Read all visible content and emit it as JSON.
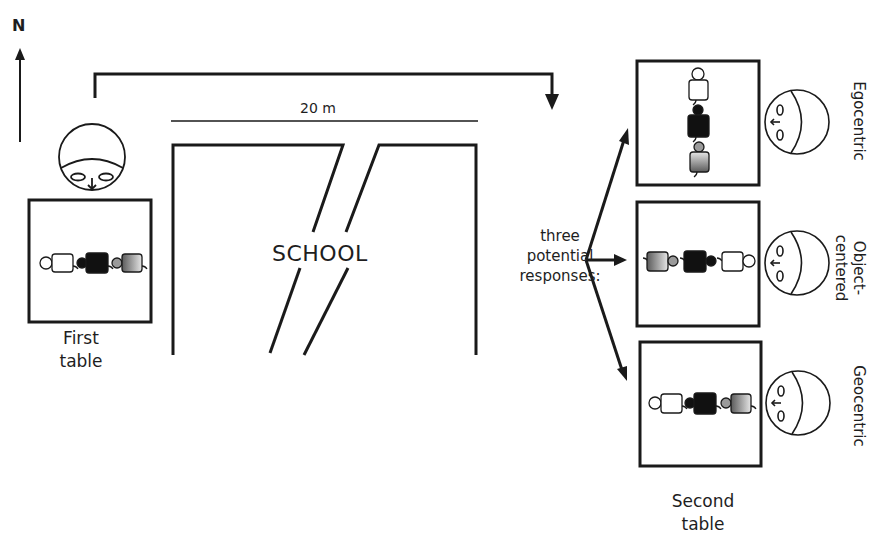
{
  "compass": {
    "label": "N",
    "direction": "up"
  },
  "scale_bar": {
    "label": "20 m"
  },
  "building": {
    "label": "SCHOOL"
  },
  "first_table": {
    "label_line1": "First",
    "label_line2": "table",
    "figures": [
      "white-figure",
      "black-figure",
      "gray-figure"
    ]
  },
  "transition": {
    "label_line1": "three",
    "label_line2": "potential",
    "label_line3": "responses:"
  },
  "second_table": {
    "label_line1": "Second",
    "label_line2": "table",
    "responses": [
      {
        "label": "Egocentric",
        "orientation": "vertical"
      },
      {
        "label_line1": "Object-",
        "label_line2": "centered",
        "orientation": "horizontal-reversed"
      },
      {
        "label": "Geocentric",
        "orientation": "horizontal"
      }
    ]
  },
  "colors": {
    "stroke": "#1a1a1a",
    "white_figure": "#ffffff",
    "black_figure": "#111111",
    "gray_figure": "#8a8a8a",
    "background": "#ffffff"
  }
}
